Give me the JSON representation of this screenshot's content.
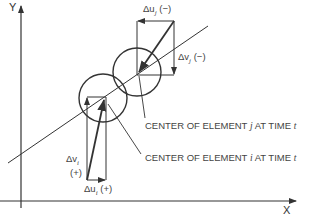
{
  "diagram": {
    "axes": {
      "y_label": "Y",
      "x_label": "X"
    },
    "element_j": {
      "du_label": "Δu",
      "du_sub": "j",
      "du_sign": "(−)",
      "dv_label": "Δv",
      "dv_sub": "j",
      "dv_sign": "(−)",
      "center_label_prefix": "CENTER OF ELEMENT ",
      "center_label_id": "j",
      "center_label_mid": " AT TIME ",
      "center_label_time": "t"
    },
    "element_i": {
      "du_label": "Δu",
      "du_sub": "i",
      "du_sign": "(+)",
      "dv_label": "Δv",
      "dv_sub": "i",
      "dv_sign": "(+)",
      "center_label_prefix": "CENTER OF ELEMENT ",
      "center_label_id": "i",
      "center_label_mid": " AT TIME ",
      "center_label_time": "t"
    },
    "colors": {
      "line": "#333333",
      "text": "#444444"
    }
  }
}
